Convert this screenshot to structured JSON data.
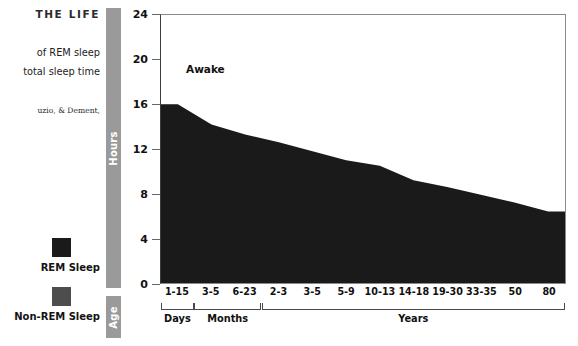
{
  "figure": {
    "heading": "THE LIFE",
    "caption_line_1": "of REM sleep",
    "caption_line_2": "total sleep time",
    "source": "uzio, & Dement,"
  },
  "legend": {
    "entries": [
      {
        "label": "REM Sleep",
        "color": "#1a1a1a",
        "icon": "rem-sleep-swatch"
      },
      {
        "label": "Non-REM Sleep",
        "color": "#4d4d4d",
        "icon": "non-rem-sleep-swatch"
      }
    ]
  },
  "axes": {
    "y_bar_label": "Hours",
    "x_bar_label": "Age"
  },
  "plot": {
    "awake_label": "Awake"
  },
  "chart_data": {
    "type": "area",
    "title": "",
    "subtitle": "",
    "xlabel": "Age",
    "ylabel": "Hours",
    "ylim": [
      0,
      24
    ],
    "yticks": [
      0,
      4,
      8,
      12,
      16,
      20,
      24
    ],
    "grid": false,
    "legend_position": "left",
    "stacked": true,
    "annotations": [
      "Awake"
    ],
    "categories": [
      "1-15",
      "3-5",
      "6-23",
      "2-3",
      "3-5",
      "5-9",
      "10-13",
      "14-18",
      "19-30",
      "33-35",
      "50",
      "80"
    ],
    "category_groups": [
      {
        "label": "Days",
        "categories": [
          "1-15"
        ]
      },
      {
        "label": "Months",
        "categories": [
          "3-5",
          "6-23"
        ]
      },
      {
        "label": "Years",
        "categories": [
          "2-3",
          "3-5",
          "5-9",
          "10-13",
          "14-18",
          "19-30",
          "33-35",
          "50",
          "80"
        ]
      }
    ],
    "series": [
      {
        "name": "Non-REM Sleep",
        "color": "#4d4d4d",
        "values": [
          8.0,
          8.8,
          9.0,
          9.0,
          8.8,
          8.5,
          8.2,
          7.3,
          6.8,
          6.3,
          5.8,
          5.3
        ]
      },
      {
        "name": "REM Sleep",
        "color": "#1a1a1a",
        "values": [
          8.0,
          5.4,
          4.3,
          3.6,
          3.0,
          2.5,
          2.3,
          1.9,
          1.8,
          1.6,
          1.4,
          1.1
        ]
      }
    ],
    "total_sleep": [
      16.0,
      14.2,
      13.3,
      12.6,
      11.8,
      11.0,
      10.5,
      9.2,
      8.6,
      7.9,
      7.2,
      6.4
    ]
  }
}
